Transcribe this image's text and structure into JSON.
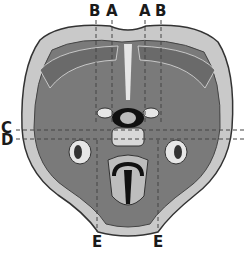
{
  "diagram": {
    "labels": {
      "top": [
        "B",
        "A",
        "A",
        "B"
      ],
      "left": [
        "C",
        "D"
      ],
      "bottom": [
        "E",
        "E"
      ]
    },
    "colors": {
      "skin": "#c9c9c9",
      "muscle": "#7a7a7a",
      "outline": "#333333",
      "dark": "#111111",
      "light": "#e6e6e6"
    }
  }
}
